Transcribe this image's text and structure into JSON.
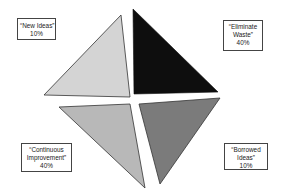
{
  "diagram": {
    "title": "",
    "quadrants": [
      {
        "id": "new-ideas",
        "label_lines": [
          "“New Ideas”",
          "10%"
        ],
        "label": "New Ideas",
        "percent": "10%",
        "color": "#d4d4d4",
        "position": "top-left"
      },
      {
        "id": "eliminate-waste",
        "label_lines": [
          "“Eliminate",
          "Waste”",
          "40%"
        ],
        "label": "Eliminate Waste",
        "percent": "40%",
        "color": "#0e0e0e",
        "position": "top-right"
      },
      {
        "id": "continuous-improvement",
        "label_lines": [
          "“Continuous",
          "Improvement”",
          "40%"
        ],
        "label": "Continuous Improvement",
        "percent": "40%",
        "color": "#b8b8b8",
        "position": "bottom-left"
      },
      {
        "id": "borrowed-ideas",
        "label_lines": [
          "“Borrowed",
          "Ideas”",
          "10%"
        ],
        "label": "Borrowed Ideas",
        "percent": "10%",
        "color": "#7b7b7b",
        "position": "bottom-right"
      }
    ]
  }
}
